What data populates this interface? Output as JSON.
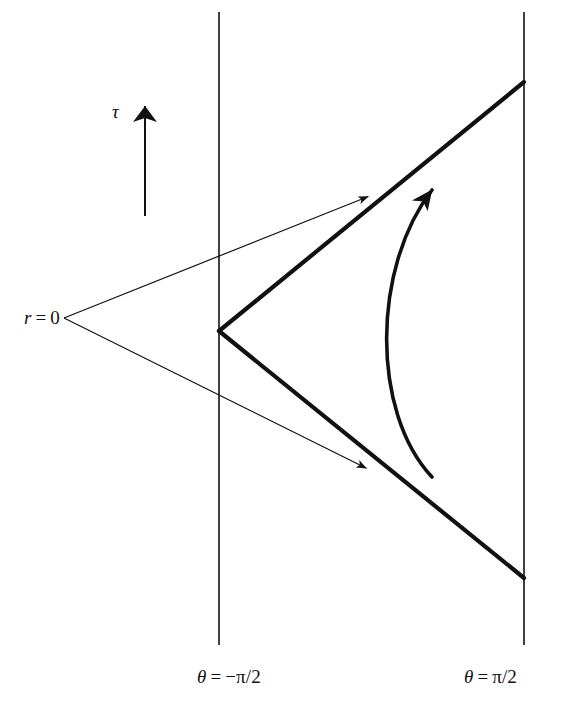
{
  "figure": {
    "type": "spacetime-conformal-diagram",
    "width": 569,
    "height": 705,
    "background_color": "#ffffff",
    "ink_color": "#111111"
  },
  "labels": {
    "time_axis": "τ",
    "origin": {
      "symbol": "r",
      "relation": "=",
      "value": "0",
      "full": "r = 0"
    },
    "left_boundary": {
      "symbol": "θ",
      "relation": "=",
      "value": "−π/2",
      "full": "θ = −π/2"
    },
    "right_boundary": {
      "symbol": "θ",
      "relation": "=",
      "value": "π/2",
      "full": "θ = π/2"
    }
  },
  "geometry": {
    "vertical_lines": [
      {
        "name": "left-boundary-line",
        "x": 219,
        "y1": 12,
        "y2": 645,
        "stroke_width": 1.6
      },
      {
        "name": "right-boundary-line",
        "x": 524,
        "y1": 12,
        "y2": 645,
        "stroke_width": 1.6
      }
    ],
    "light_cone": {
      "name": "thick-v-lightcone",
      "vertex": [
        219,
        331
      ],
      "upper_end": [
        524,
        82
      ],
      "lower_end": [
        524,
        578
      ],
      "stroke_width": 4.2
    },
    "null_rays": [
      {
        "name": "upper-null-ray",
        "start": [
          64,
          318
        ],
        "end": [
          372,
          195
        ],
        "stroke_width": 1.2,
        "arrowhead": true
      },
      {
        "name": "lower-null-ray",
        "start": [
          64,
          318
        ],
        "end": [
          370,
          470
        ],
        "stroke_width": 1.2,
        "arrowhead": true
      }
    ],
    "tau_arrow": {
      "name": "tau-axis-arrow",
      "x": 145,
      "y_tail": 216,
      "y_tip": 87,
      "stroke_width": 2.0
    },
    "worldline": {
      "name": "curved-worldline-arrow",
      "start": [
        432,
        477
      ],
      "control_1": [
        371,
        412
      ],
      "control_2": [
        372,
        268
      ],
      "end": [
        443,
        178
      ],
      "stroke_width": 3.6,
      "arrowhead": true,
      "leftmost_x": 370
    }
  },
  "chart_data": {
    "type": "line",
    "title": "",
    "xlabel": "θ",
    "ylabel": "τ",
    "xlim": [
      "-π/2",
      "π/2"
    ],
    "annotations": [
      "r = 0",
      "θ = −π/2",
      "θ = π/2",
      "τ"
    ],
    "legend": [],
    "grid": false
  }
}
